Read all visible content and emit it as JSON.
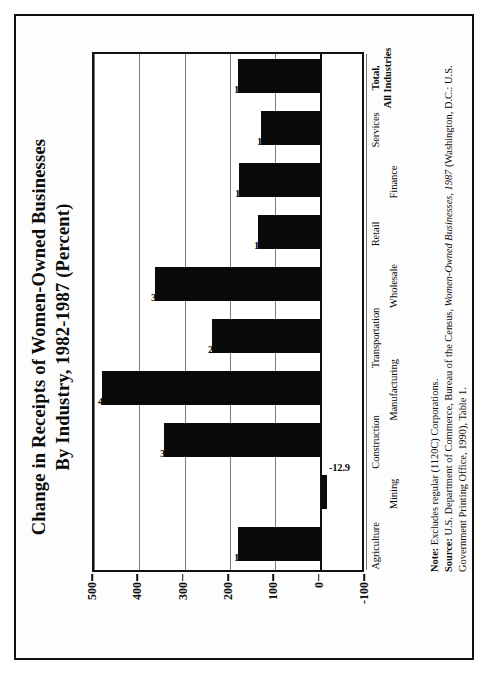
{
  "figure": {
    "title_line1": "Change  in  Receipts  of  Women-Owned  Businesses",
    "title_line2": "By  Industry,  1982-1987  (Percent)"
  },
  "notes": {
    "note_label": "Note:",
    "note_text": " Excludes regular (1120C) Corporations.",
    "source_label": "Source:",
    "source_text_a": " U.S. Department of Commerce, Bureau of the Census, ",
    "source_italic": "Women-Owned Businesses, 1987",
    "source_text_b": " (Washington, D.C.: U.S. Government Printing Office, 1990), Table 1."
  },
  "chart_data": {
    "type": "bar",
    "title": "Change in Receipts of Women-Owned Businesses By Industry, 1982-1987 (Percent)",
    "xlabel": "",
    "ylabel": "",
    "ylim": [
      -100,
      500
    ],
    "yticks": [
      500,
      400,
      300,
      200,
      100,
      0,
      -100
    ],
    "ytick_labels": [
      "500",
      "400",
      "300",
      "200",
      "100",
      "0",
      "-100"
    ],
    "grid": true,
    "legend": "none",
    "bar_color": "#0a0a0a",
    "categories": [
      "Agriculture",
      "Mining",
      "Construction",
      "Manufacturing",
      "Transportation",
      "Wholesale",
      "Retail",
      "Finance",
      "Services",
      "Total,\nAll Industries"
    ],
    "category_labels": [
      "Agriculture",
      "Mining",
      "Construction",
      "Manufacturing",
      "Transportation",
      "Wholesale",
      "Retail",
      "Finance",
      "Services",
      "Total,"
    ],
    "total_label_line2": "All Industries",
    "values": [
      181.9,
      -12.9,
      344.7,
      483.0,
      238.7,
      365.8,
      138.2,
      180.0,
      132.6,
      183.0
    ],
    "data_labels": [
      "181.9",
      "-12.9",
      "344.7",
      "483.0",
      "238.7",
      "365.8",
      "138.2",
      "180.0",
      "132.6",
      "183.0"
    ]
  }
}
